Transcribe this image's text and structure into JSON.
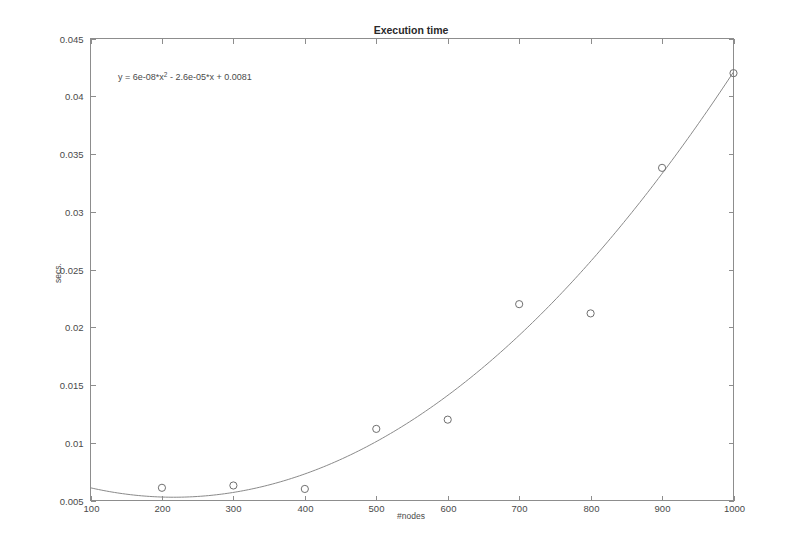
{
  "chart_data": {
    "type": "scatter",
    "title": "Execution time",
    "xlabel": "#nodes",
    "ylabel": "secs.",
    "x": [
      200,
      300,
      400,
      500,
      600,
      700,
      800,
      900,
      1000
    ],
    "values": [
      0.0061,
      0.0063,
      0.006,
      0.0112,
      0.012,
      0.022,
      0.0212,
      0.0338,
      0.042
    ],
    "series": [
      {
        "name": "measured",
        "marker": "open-circle",
        "x": [
          200,
          300,
          400,
          500,
          600,
          700,
          800,
          900,
          1000
        ],
        "values": [
          0.0061,
          0.0063,
          0.006,
          0.0112,
          0.012,
          0.022,
          0.0212,
          0.0338,
          0.042
        ]
      },
      {
        "name": "quadratic-fit",
        "type": "line",
        "equation": "y = 6e-08*x^2 - 2.6e-05*x + 0.0081",
        "coefficients": {
          "a": 6e-08,
          "b": -2.6e-05,
          "c": 0.0081
        }
      }
    ],
    "annotation": {
      "equation_prefix": "y = 6e-08*x",
      "equation_exponent": "2",
      "equation_suffix": " - 2.6e-05*x + 0.0081"
    },
    "xlim": [
      100,
      1000
    ],
    "ylim": [
      0.005,
      0.045
    ],
    "xticks": [
      100,
      200,
      300,
      400,
      500,
      600,
      700,
      800,
      900,
      1000
    ],
    "xticklabels": [
      "100",
      "200",
      "300",
      "400",
      "500",
      "600",
      "700",
      "800",
      "900",
      "1000"
    ],
    "yticks": [
      0.005,
      0.01,
      0.015,
      0.02,
      0.025,
      0.03,
      0.035,
      0.04,
      0.045
    ],
    "yticklabels": [
      "0.005",
      "0.01",
      "0.015",
      "0.02",
      "0.025",
      "0.03",
      "0.035",
      "0.04",
      "0.045"
    ],
    "grid": false,
    "legend": null,
    "box": true,
    "colors": {
      "axis": "#8d8d8d",
      "curve": "#8a8a8a",
      "marker": "#6f6f6f",
      "text": "#4a4a4a",
      "background": "#ffffff"
    }
  }
}
